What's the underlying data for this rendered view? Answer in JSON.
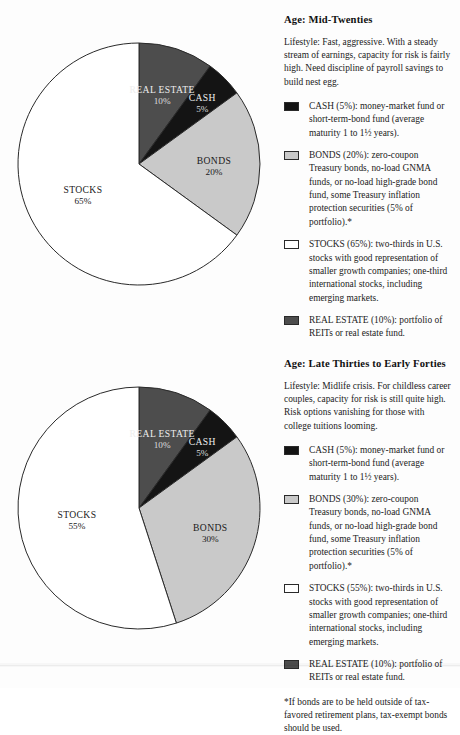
{
  "colors": {
    "cash": "#141414",
    "bonds": "#c9c9c9",
    "stocks": "#ffffff",
    "real_estate": "#4d4d4d",
    "outline": "#2a2a2a",
    "page_background": "#fdfdfd",
    "text": "#1c1c1c"
  },
  "panels": [
    {
      "heading": "Age: Mid-Twenties",
      "lifestyle": "Lifestyle: Fast, aggressive. With a steady stream of earnings, capacity for risk is fairly high. Need discipline of payroll savings to build nest egg.",
      "legend": [
        {
          "swatch": "cash-swatch",
          "color": "#141414",
          "text": "CASH (5%): money-market fund or short-term-bond fund (average maturity 1 to 1½ years)."
        },
        {
          "swatch": "bonds-swatch",
          "color": "#c9c9c9",
          "text": "BONDS (20%): zero-coupon Treasury bonds, no-load GNMA funds, or no-load high-grade bond fund, some Treasury inflation protection securities (5% of portfolio).*"
        },
        {
          "swatch": "stocks-swatch",
          "color": "#ffffff",
          "text": "STOCKS (65%): two-thirds in U.S. stocks with good representation of smaller growth companies; one-third international stocks, including emerging markets."
        },
        {
          "swatch": "real-estate-swatch",
          "color": "#4d4d4d",
          "text": "REAL ESTATE (10%): portfolio of REITs or real estate fund."
        }
      ],
      "footnote": ""
    },
    {
      "heading": "Age: Late Thirties to Early Forties",
      "lifestyle": "Lifestyle: Midlife crisis. For childless career couples, capacity for risk is still quite high. Risk options vanishing for those with college tuitions looming.",
      "legend": [
        {
          "swatch": "cash-swatch",
          "color": "#141414",
          "text": "CASH (5%): money-market fund or short-term-bond fund (average maturity 1 to 1½ years)."
        },
        {
          "swatch": "bonds-swatch",
          "color": "#c9c9c9",
          "text": "BONDS (30%): zero-coupon Treasury bonds, no-load GNMA funds, or no-load high-grade bond fund, some Treasury inflation protection securities (5% of portfolio).*"
        },
        {
          "swatch": "stocks-swatch",
          "color": "#ffffff",
          "text": "STOCKS (55%): two-thirds in U.S. stocks with good representation of smaller growth companies; one-third international stocks, including emerging markets."
        },
        {
          "swatch": "real-estate-swatch",
          "color": "#4d4d4d",
          "text": "REAL ESTATE (10%): portfolio of REITs or real estate fund."
        }
      ],
      "footnote": "*If bonds are to be held outside of tax-favored retirement plans, tax-exempt bonds should be used."
    }
  ],
  "chart_data": [
    {
      "type": "pie",
      "title": "Age: Mid-Twenties",
      "categories": [
        "REAL ESTATE",
        "CASH",
        "BONDS",
        "STOCKS"
      ],
      "values": [
        10,
        5,
        20,
        65
      ],
      "labels": [
        "REAL ESTATE",
        "CASH",
        "BONDS",
        "STOCKS"
      ],
      "value_labels": [
        "10%",
        "5%",
        "20%",
        "65%"
      ],
      "colors": [
        "#4d4d4d",
        "#141414",
        "#c9c9c9",
        "#ffffff"
      ],
      "start_angle_deg": 0,
      "direction": "clockwise",
      "legend_position": "right",
      "grid": false,
      "xlabel": "",
      "ylabel": ""
    },
    {
      "type": "pie",
      "title": "Age: Late Thirties to Early Forties",
      "categories": [
        "REAL ESTATE",
        "CASH",
        "BONDS",
        "STOCKS"
      ],
      "values": [
        10,
        5,
        30,
        55
      ],
      "labels": [
        "REAL ESTATE",
        "CASH",
        "BONDS",
        "STOCKS"
      ],
      "value_labels": [
        "10%",
        "5%",
        "30%",
        "55%"
      ],
      "colors": [
        "#4d4d4d",
        "#141414",
        "#c9c9c9",
        "#ffffff"
      ],
      "start_angle_deg": 0,
      "direction": "clockwise",
      "legend_position": "right",
      "grid": false,
      "xlabel": "",
      "ylabel": ""
    }
  ]
}
